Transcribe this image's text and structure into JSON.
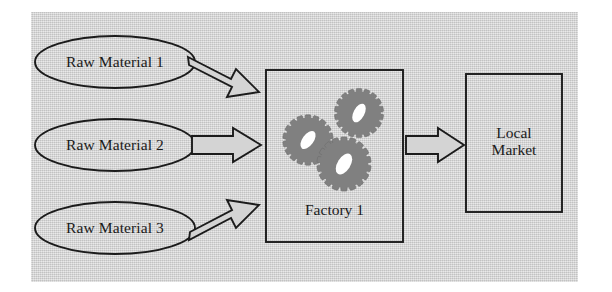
{
  "diagram": {
    "canvas": {
      "background_color": "#d4d4d4",
      "page_color": "#ffffff",
      "stroke_color": "#1b1b1b"
    },
    "inputs": [
      {
        "id": "raw-material-1",
        "label": "Raw Material 1",
        "shape": "ellipse"
      },
      {
        "id": "raw-material-2",
        "label": "Raw Material 2",
        "shape": "ellipse"
      },
      {
        "id": "raw-material-3",
        "label": "Raw Material 3",
        "shape": "ellipse"
      }
    ],
    "process": {
      "id": "factory-1",
      "label": "Factory 1",
      "shape": "rectangle",
      "icon": "gears-icon",
      "gear_count": 3,
      "gear_fill_color": "#808080",
      "gear_hub_color": "#ffffff"
    },
    "output": {
      "id": "local-market",
      "label": "Local\nMarket",
      "label_line_1": "Local",
      "label_line_2": "Market",
      "shape": "rectangle"
    },
    "connectors": [
      {
        "id": "arrow-raw-material-1-to-factory",
        "from": "raw-material-1",
        "to": "factory-1",
        "style": "hollow-block-arrow",
        "direction": "down-right"
      },
      {
        "id": "arrow-raw-material-2-to-factory",
        "from": "raw-material-2",
        "to": "factory-1",
        "style": "hollow-block-arrow",
        "direction": "right"
      },
      {
        "id": "arrow-raw-material-3-to-factory",
        "from": "raw-material-3",
        "to": "factory-1",
        "style": "hollow-block-arrow",
        "direction": "up-right"
      },
      {
        "id": "arrow-factory-to-local-market",
        "from": "factory-1",
        "to": "local-market",
        "style": "hollow-block-arrow",
        "direction": "right"
      }
    ]
  }
}
